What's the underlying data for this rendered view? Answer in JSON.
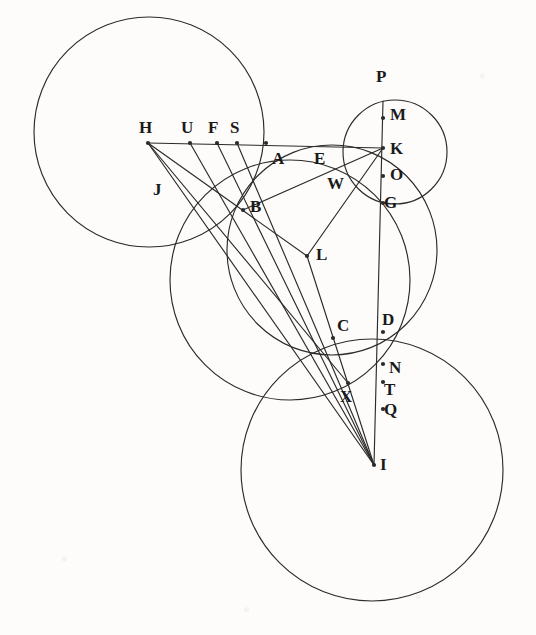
{
  "figure": {
    "kind": "geometric-construction-diagram",
    "background_color": "#fdfcfa",
    "stroke_color": "#2b2b2b",
    "label_color": "#1a1a1a",
    "width": 536,
    "height": 635
  },
  "points": [
    {
      "id": "H",
      "label": "H",
      "x": 148,
      "y": 143,
      "dot": true,
      "lx": 139,
      "ly": 119
    },
    {
      "id": "U",
      "label": "U",
      "x": 190,
      "y": 143,
      "dot": true,
      "lx": 181,
      "ly": 119
    },
    {
      "id": "F",
      "label": "F",
      "x": 217,
      "y": 143,
      "dot": true,
      "lx": 208,
      "ly": 119
    },
    {
      "id": "S",
      "label": "S",
      "x": 237,
      "y": 143,
      "dot": true,
      "lx": 230,
      "ly": 119
    },
    {
      "id": "A",
      "label": "A",
      "x": 266,
      "y": 143,
      "dot": true,
      "lx": 272,
      "ly": 150
    },
    {
      "id": "E",
      "label": "E",
      "x": 321,
      "y": 143,
      "dot": false,
      "lx": 314,
      "ly": 150
    },
    {
      "id": "K",
      "label": "K",
      "x": 383,
      "y": 148,
      "dot": true,
      "lx": 390,
      "ly": 140
    },
    {
      "id": "P",
      "label": "P",
      "x": 383,
      "y": 101,
      "dot": false,
      "lx": 376,
      "ly": 68
    },
    {
      "id": "M",
      "label": "M",
      "x": 383,
      "y": 118,
      "dot": true,
      "lx": 390,
      "ly": 106
    },
    {
      "id": "O",
      "label": "O",
      "x": 383,
      "y": 176,
      "dot": true,
      "lx": 390,
      "ly": 166
    },
    {
      "id": "G",
      "label": "G",
      "x": 383,
      "y": 203,
      "dot": true,
      "lx": 384,
      "ly": 194
    },
    {
      "id": "W",
      "label": "W",
      "x": 340,
      "y": 180,
      "dot": false,
      "lx": 327,
      "ly": 175
    },
    {
      "id": "J",
      "label": "J",
      "x": 160,
      "y": 190,
      "dot": false,
      "lx": 153,
      "ly": 181
    },
    {
      "id": "B",
      "label": "B",
      "x": 243,
      "y": 210,
      "dot": true,
      "lx": 250,
      "ly": 198
    },
    {
      "id": "L",
      "label": "L",
      "x": 307,
      "y": 256,
      "dot": true,
      "lx": 316,
      "ly": 246
    },
    {
      "id": "D",
      "label": "D",
      "x": 383,
      "y": 332,
      "dot": true,
      "lx": 382,
      "ly": 311
    },
    {
      "id": "C",
      "label": "C",
      "x": 333,
      "y": 338,
      "dot": true,
      "lx": 337,
      "ly": 317
    },
    {
      "id": "N",
      "label": "N",
      "x": 383,
      "y": 364,
      "dot": true,
      "lx": 389,
      "ly": 359
    },
    {
      "id": "T",
      "label": "T",
      "x": 383,
      "y": 382,
      "dot": true,
      "lx": 384,
      "ly": 381
    },
    {
      "id": "Q",
      "label": "Q",
      "x": 383,
      "y": 409,
      "dot": true,
      "lx": 384,
      "ly": 401
    },
    {
      "id": "X",
      "label": "X",
      "x": 348,
      "y": 383,
      "dot": true,
      "lx": 340,
      "ly": 388
    },
    {
      "id": "I",
      "label": "I",
      "x": 374,
      "y": 465,
      "dot": true,
      "lx": 380,
      "ly": 456
    }
  ],
  "circles": [
    {
      "id": "circle-left-large",
      "cx": 149,
      "cy": 132,
      "r": 115
    },
    {
      "id": "circle-middle-large",
      "cx": 290,
      "cy": 280,
      "r": 120
    },
    {
      "id": "circle-right-large",
      "cx": 332,
      "cy": 250,
      "r": 105
    },
    {
      "id": "circle-bottom-large",
      "cx": 372,
      "cy": 470,
      "r": 131
    },
    {
      "id": "circle-small-top",
      "cx": 395,
      "cy": 152,
      "r": 52
    }
  ],
  "segments": [
    {
      "id": "seg-H-K",
      "from": "H",
      "to": "K"
    },
    {
      "id": "seg-P-I",
      "from": "P",
      "to": "I"
    },
    {
      "id": "seg-H-L",
      "from": "H",
      "to": "L"
    },
    {
      "id": "seg-H-X",
      "from": "H",
      "to": "X"
    },
    {
      "id": "seg-H-I",
      "from": "H",
      "to": "I"
    },
    {
      "id": "seg-U-I",
      "from": "U",
      "to": "I"
    },
    {
      "id": "seg-F-I",
      "from": "F",
      "to": "I"
    },
    {
      "id": "seg-S-I",
      "from": "S",
      "to": "I"
    },
    {
      "id": "seg-K-B",
      "from": "K",
      "to": "B"
    },
    {
      "id": "seg-K-L",
      "from": "K",
      "to": "L"
    },
    {
      "id": "seg-L-I",
      "from": "L",
      "to": "I"
    }
  ],
  "caption": ""
}
